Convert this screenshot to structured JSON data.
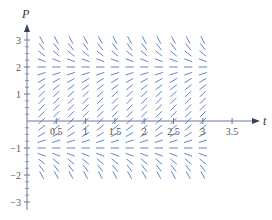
{
  "chart_data": {
    "type": "slope_field",
    "title": "",
    "xlabel": "t",
    "ylabel": "P",
    "xlim": [
      0,
      3.7
    ],
    "ylim": [
      -3,
      3.4
    ],
    "x_ticks": [
      0.5,
      1,
      1.5,
      2,
      2.5,
      3,
      3.5
    ],
    "x_tick_labels": [
      "0.5",
      "1",
      "1.5",
      "2",
      "2.5",
      "3",
      "3.5"
    ],
    "y_ticks": [
      -3,
      -2,
      -1,
      1,
      2,
      3
    ],
    "y_tick_labels": [
      "-3",
      "-2",
      "-1",
      "1",
      "2",
      "3"
    ],
    "grid": false,
    "field": {
      "t_start": 0.25,
      "t_end": 3.0,
      "t_step": 0.25,
      "p_start": -2.0,
      "p_end": 3.0,
      "p_step": 0.25,
      "equation": "dP/dt = (P + 1)(2 - P)",
      "equilibria": [
        -1,
        2
      ]
    },
    "colors": {
      "segment": "#4a6fb5",
      "axis": "#6b7a99",
      "text": "#555555"
    }
  }
}
